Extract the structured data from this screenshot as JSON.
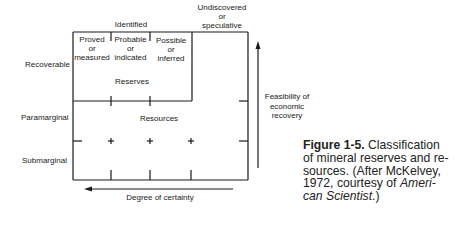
{
  "diagram": {
    "column_header_identified": "Identified",
    "column_header_undiscovered": [
      "Undiscovered",
      "or",
      "speculative"
    ],
    "identified_subcolumns": [
      [
        "Proved",
        "or",
        "measured"
      ],
      [
        "Probable",
        "or",
        "indicated"
      ],
      [
        "Possible",
        "or",
        "inferred"
      ]
    ],
    "row_labels": {
      "recoverable": "Recoverable",
      "paramarginal": "Paramarginal",
      "submarginal": "Submarginal"
    },
    "region_labels": {
      "reserves": "Reserves",
      "resources": "Resources"
    },
    "axis_labels": {
      "vertical": [
        "Feasibility of",
        "economic",
        "recovery"
      ],
      "horizontal": "Degree of certainty"
    }
  },
  "caption": {
    "figure_number": "Figure 1-5.",
    "line1_rest": "Classification",
    "line2": "of mineral reserves and re-",
    "line3": "sources. (After McKelvey,",
    "line4_pre": "1972, courtesy of ",
    "line4_italic": "Ameri-",
    "line5_italic": "can Scientist",
    "line5_post": ".)"
  }
}
